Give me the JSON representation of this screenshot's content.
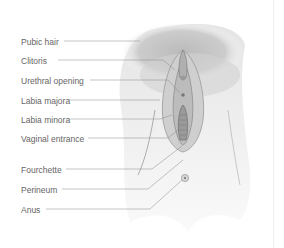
{
  "diagram": {
    "type": "anatomical-labeled-illustration",
    "labels": [
      {
        "text": "Pubic hair",
        "y": 37
      },
      {
        "text": "Clitoris",
        "y": 56
      },
      {
        "text": "Urethral opening",
        "y": 76
      },
      {
        "text": "Labia majora",
        "y": 96
      },
      {
        "text": "Labia minora",
        "y": 115
      },
      {
        "text": "Vaginal entrance",
        "y": 134
      },
      {
        "text": "Fourchette",
        "y": 165
      },
      {
        "text": "Perineum",
        "y": 186
      },
      {
        "text": "Anus",
        "y": 206
      }
    ]
  }
}
